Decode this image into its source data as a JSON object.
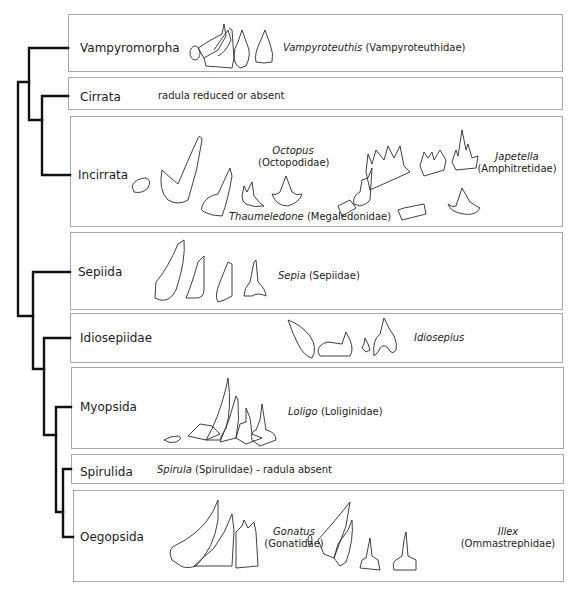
{
  "figure": {
    "colors": {
      "tree": "#111111",
      "box_border": "#a8a8a8",
      "outline": "#2a2a2a"
    }
  },
  "clades": [
    {
      "name": "Vampyromorpha",
      "genus": "Vampyroteuthis",
      "family": "(Vampyroteuthidae)",
      "note": ""
    },
    {
      "name": "Cirrata",
      "genus": "",
      "family": "",
      "note": "radula reduced or absent"
    },
    {
      "name": "Incirrata",
      "taxa": [
        {
          "genus": "Octopus",
          "family": "(Octopodidae)"
        },
        {
          "genus": "Thaumeledone",
          "family": "(Megaledonidae)"
        },
        {
          "genus": "Japetella",
          "family": "(Amphitretidae)"
        }
      ]
    },
    {
      "name": "Sepiida",
      "genus": "Sepia",
      "family": "(Sepiidae)"
    },
    {
      "name": "Idiosepiidae",
      "genus": "Idiosepius",
      "family": ""
    },
    {
      "name": "Myopsida",
      "genus": "Loligo",
      "family": "(Loliginidae)"
    },
    {
      "name": "Spirulida",
      "genus": "Spirula",
      "family": "(Spirulidae)",
      "note": "- radula absent"
    },
    {
      "name": "Oegopsida",
      "taxa": [
        {
          "genus": "Gonatus",
          "family": "(Gonatidae)"
        },
        {
          "genus": "Illex",
          "family": "(Ommastrephidae)"
        }
      ]
    }
  ],
  "tree": {
    "topology": "((Vampyromorpha,(Cirrata,Incirrata)),(Sepiida,(Idiosepiidae,(Myopsida,(Spirulida,Oegopsida)))))"
  }
}
